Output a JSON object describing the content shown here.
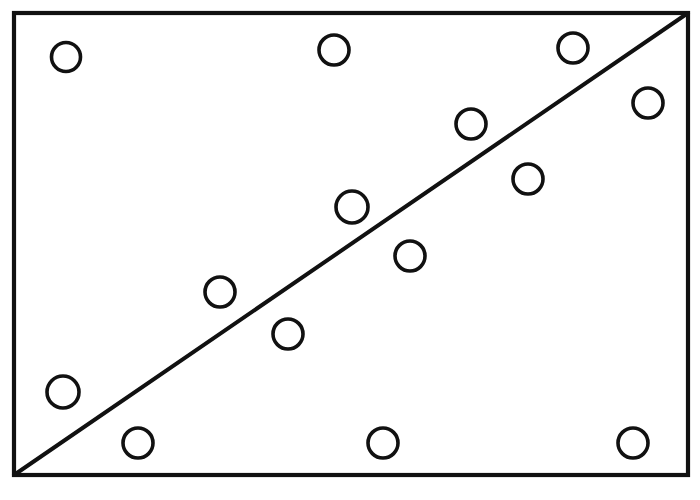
{
  "figure": {
    "title": "",
    "subtitle": "",
    "style": "hand-drawn-scanned",
    "background_color": "#fdfdfc",
    "ink_color": "#111111",
    "point_fill_color": "#ffffff"
  },
  "frame": {
    "name": "plot-frame",
    "left": 14,
    "top": 13,
    "right": 688,
    "bottom": 475,
    "stroke_width": 4.2,
    "closed": true
  },
  "chart_data": {
    "type": "scatter",
    "title": "",
    "subtitle": "",
    "xlabel": "",
    "ylabel": "",
    "xlim": [
      14,
      688
    ],
    "ylim": [
      475,
      13
    ],
    "grid": false,
    "legend": null,
    "axis_ticks": {
      "x": [],
      "y": []
    },
    "marker": {
      "shape": "circle",
      "filled": false,
      "radius_px": 15,
      "edge_color": "#111111",
      "face_color": "#ffffff"
    },
    "n_points": 14,
    "points": [
      {
        "id": 1,
        "x": 66,
        "y": 57,
        "r": 14.5
      },
      {
        "id": 2,
        "x": 334,
        "y": 50,
        "r": 15.0
      },
      {
        "id": 3,
        "x": 573,
        "y": 48,
        "r": 15.0
      },
      {
        "id": 4,
        "x": 648,
        "y": 103,
        "r": 15.0
      },
      {
        "id": 5,
        "x": 471,
        "y": 124,
        "r": 15.0
      },
      {
        "id": 6,
        "x": 528,
        "y": 179,
        "r": 15.0
      },
      {
        "id": 7,
        "x": 352,
        "y": 207,
        "r": 16.0
      },
      {
        "id": 8,
        "x": 410,
        "y": 256,
        "r": 15.0
      },
      {
        "id": 9,
        "x": 220,
        "y": 292,
        "r": 15.0
      },
      {
        "id": 10,
        "x": 288,
        "y": 334,
        "r": 15.0
      },
      {
        "id": 11,
        "x": 63,
        "y": 392,
        "r": 16.0
      },
      {
        "id": 12,
        "x": 138,
        "y": 443,
        "r": 15.0
      },
      {
        "id": 13,
        "x": 383,
        "y": 443,
        "r": 15.0
      },
      {
        "id": 14,
        "x": 633,
        "y": 443,
        "r": 15.0
      }
    ],
    "annotations": [],
    "trend_line": {
      "name": "regression-line",
      "kind": "straight",
      "x1": 14,
      "y1": 475,
      "x2": 688,
      "y2": 13,
      "stroke_width": 4.0,
      "label": ""
    }
  }
}
